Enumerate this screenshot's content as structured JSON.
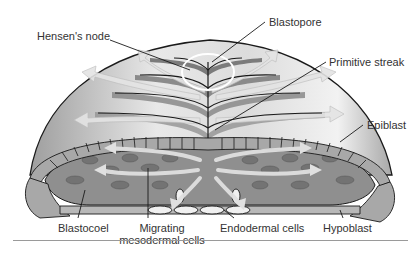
{
  "figure": {
    "labels": {
      "hensens_node": "Hensen's node",
      "blastopore": "Blastopore",
      "primitive_streak": "Primitive streak",
      "epiblast": "Epiblast",
      "blastocoel": "Blastocoel",
      "migrating_line1": "Migrating",
      "migrating_line2": "mesodermal cells",
      "endodermal_cells": "Endodermal cells",
      "hypoblast": "Hypoblast"
    },
    "colors": {
      "dome_light": "#e6e6e6",
      "dome_mid": "#c4c4c4",
      "streak_dark": "#6e6e6e",
      "arrow_light": "#d9d9d9",
      "cell_fill": "#a8a8a8",
      "blastocoel_fill": "#8c8c8c",
      "mesoderm_cell": "#7a7a7a",
      "endoderm_cell": "#f0f0f0",
      "outline": "#1a1a1a",
      "node_circle": "#ffffff",
      "rule": "#9a9a9a"
    }
  }
}
